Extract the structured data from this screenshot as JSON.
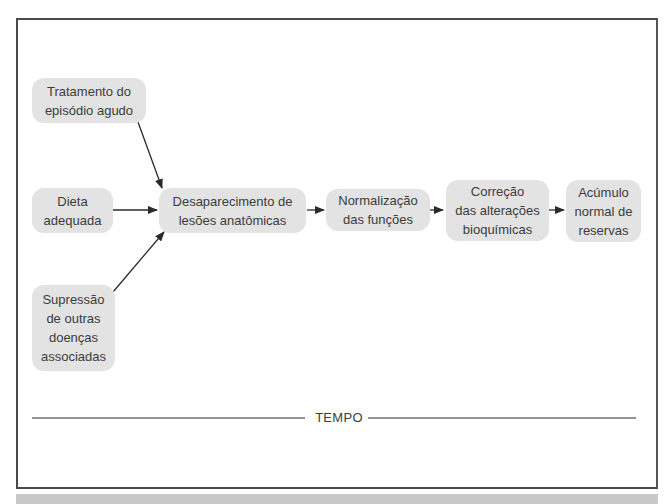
{
  "diagram": {
    "inputs": [
      {
        "id": "tratamento",
        "lines": [
          "Tratamento do",
          "episódio agudo"
        ]
      },
      {
        "id": "dieta",
        "lines": [
          "Dieta",
          "adequada"
        ]
      },
      {
        "id": "supressao",
        "lines": [
          "Supressão",
          "de outras",
          "doenças",
          "associadas"
        ]
      }
    ],
    "sequence": [
      {
        "id": "desaparecimento",
        "lines": [
          "Desaparecimento de",
          "lesões anatômicas"
        ]
      },
      {
        "id": "normalizacao",
        "lines": [
          "Normalização",
          "das funções"
        ]
      },
      {
        "id": "correcao",
        "lines": [
          "Correção",
          "das alterações",
          "bioquímicas"
        ]
      },
      {
        "id": "acumulo",
        "lines": [
          "Acúmulo",
          "normal de",
          "reservas"
        ]
      }
    ],
    "edges": [
      {
        "from": "tratamento",
        "to": "desaparecimento"
      },
      {
        "from": "dieta",
        "to": "desaparecimento"
      },
      {
        "from": "supressao",
        "to": "desaparecimento"
      },
      {
        "from": "desaparecimento",
        "to": "normalizacao"
      },
      {
        "from": "normalizacao",
        "to": "correcao"
      },
      {
        "from": "correcao",
        "to": "acumulo"
      }
    ],
    "timeline": {
      "label": "TEMPO"
    },
    "colors": {
      "node_fill": "#e3e3e3",
      "line": "#2a2a2a",
      "frame": "#4a4a4a",
      "bottom_bar": "#c8c8c8"
    }
  }
}
